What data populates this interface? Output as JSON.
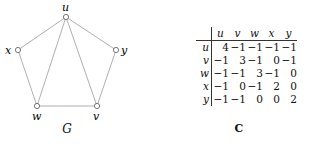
{
  "graph": {
    "caption": "G",
    "vertices": [
      {
        "id": "u",
        "label": "u",
        "x": 66,
        "y": 17,
        "lx": 62,
        "ly": 11
      },
      {
        "id": "x",
        "label": "x",
        "x": 18,
        "y": 50,
        "lx": 5,
        "ly": 54
      },
      {
        "id": "y",
        "label": "y",
        "x": 116,
        "y": 50,
        "lx": 121,
        "ly": 54
      },
      {
        "id": "w",
        "label": "w",
        "x": 37,
        "y": 106,
        "lx": 32,
        "ly": 120
      },
      {
        "id": "v",
        "label": "v",
        "x": 97,
        "y": 106,
        "lx": 93,
        "ly": 120
      }
    ],
    "edges": [
      [
        "u",
        "x"
      ],
      [
        "u",
        "y"
      ],
      [
        "u",
        "w"
      ],
      [
        "u",
        "v"
      ],
      [
        "x",
        "w"
      ],
      [
        "y",
        "v"
      ],
      [
        "w",
        "v"
      ]
    ]
  },
  "matrix": {
    "caption": "C",
    "columns": [
      "u",
      "v",
      "w",
      "x",
      "y"
    ],
    "rows": [
      {
        "label": "u",
        "values": [
          "4",
          "−1",
          "−1",
          "−1",
          "−1"
        ]
      },
      {
        "label": "v",
        "values": [
          "−1",
          "3",
          "−1",
          "0",
          "−1"
        ]
      },
      {
        "label": "w",
        "values": [
          "−1",
          "−1",
          "3",
          "−1",
          "0"
        ]
      },
      {
        "label": "x",
        "values": [
          "−1",
          "0",
          "−1",
          "2",
          "0"
        ]
      },
      {
        "label": "y",
        "values": [
          "−1",
          "−1",
          "0",
          "0",
          "2"
        ]
      }
    ]
  }
}
